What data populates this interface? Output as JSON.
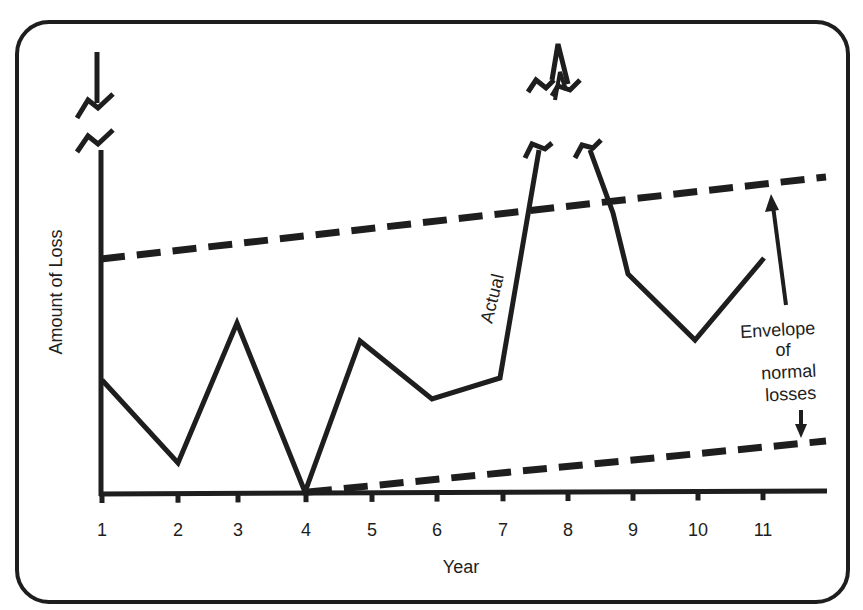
{
  "chart_data": {
    "type": "line",
    "title": "",
    "xlabel": "Year",
    "ylabel": "Amount of Loss",
    "x": [
      1,
      2,
      3,
      4,
      5,
      6,
      7,
      8,
      9,
      10,
      11
    ],
    "x_tick_labels": [
      "1",
      "2",
      "3",
      "4",
      "5",
      "6",
      "7",
      "8",
      "9",
      "10",
      "11"
    ],
    "y_ticks": [],
    "grid": false,
    "series": [
      {
        "name": "Actual",
        "style": "solid",
        "values": [
          0.49,
          0.13,
          0.74,
          0.0,
          0.66,
          0.41,
          0.5,
          "off-scale (break)",
          0.94,
          0.66,
          1.0
        ],
        "note": "Year 8 value exceeds chart range; shown with axis break symbols"
      },
      {
        "name": "Envelope of normal losses (upper bound)",
        "style": "dashed",
        "x": [
          1,
          11.4
        ],
        "values": [
          1.02,
          1.35
        ]
      },
      {
        "name": "Envelope of normal losses (lower bound)",
        "style": "dashed",
        "x": [
          4,
          11.4
        ],
        "values": [
          0.0,
          0.22
        ]
      }
    ],
    "annotations": [
      {
        "text": "Actual",
        "target": "Actual line between years 7 and 8",
        "rotation": -75
      },
      {
        "text": "Envelope of normal losses",
        "target": "arrows pointing to upper and lower dashed lines"
      }
    ],
    "axis_breaks": [
      "y-axis top",
      "Actual line peak near year 8"
    ],
    "legend_position": "none"
  },
  "labels": {
    "ylabel": "Amount of Loss",
    "xlabel": "Year",
    "actual": "Actual",
    "envelope_lines": [
      "Envelope",
      "of",
      "normal",
      "losses"
    ],
    "ticks": [
      "1",
      "2",
      "3",
      "4",
      "5",
      "6",
      "7",
      "8",
      "9",
      "10",
      "11"
    ]
  },
  "colors": {
    "ink": "#1e1e1e",
    "background": "#ffffff"
  }
}
